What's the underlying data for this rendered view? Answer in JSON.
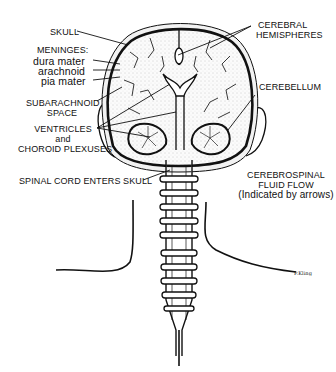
{
  "diagram": {
    "labels": {
      "skull": "SKULL",
      "meninges_heading": "MENINGES:",
      "dura_mater": "dura mater",
      "arachnoid": "arachnoid",
      "pia_mater": "pia mater",
      "subarachnoid_line1": "SUBARACHNOID",
      "subarachnoid_line2": "SPACE",
      "ventricles_line1": "VENTRICLES",
      "ventricles_line2": "and",
      "ventricles_line3": "CHOROID PLEXUSES",
      "spinal_cord": "SPINAL CORD ENTERS SKULL",
      "cerebral_line1": "CEREBRAL",
      "cerebral_line2": "HEMISPHERES",
      "cerebellum": "CEREBELLUM",
      "csf_line1": "CEREBROSPINAL",
      "csf_line2": "FLUID FLOW",
      "csf_line3": "(Indicated by arrows)",
      "signature": "P.Kling"
    },
    "colors": {
      "ink": "#111111",
      "stipple": "#e9e9e9",
      "background": "#ffffff"
    }
  }
}
